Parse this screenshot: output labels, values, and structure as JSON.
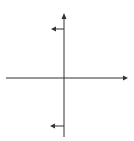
{
  "diagram": {
    "type": "coordinate-axes",
    "stroke_color": "#333333",
    "background": "#ffffff",
    "x_axis": {
      "y": 78,
      "x_start": 6,
      "x_end": 128,
      "arrow": "right"
    },
    "y_axis": {
      "x": 64,
      "y_start": 137,
      "y_end": 13,
      "arrow": "up"
    },
    "vectors": [
      {
        "name": "upper-left-arrow",
        "y": 29,
        "x_start": 64,
        "x_end": 51,
        "direction": "left"
      },
      {
        "name": "lower-left-arrow",
        "y": 126,
        "x_start": 64,
        "x_end": 50,
        "direction": "left"
      }
    ]
  }
}
